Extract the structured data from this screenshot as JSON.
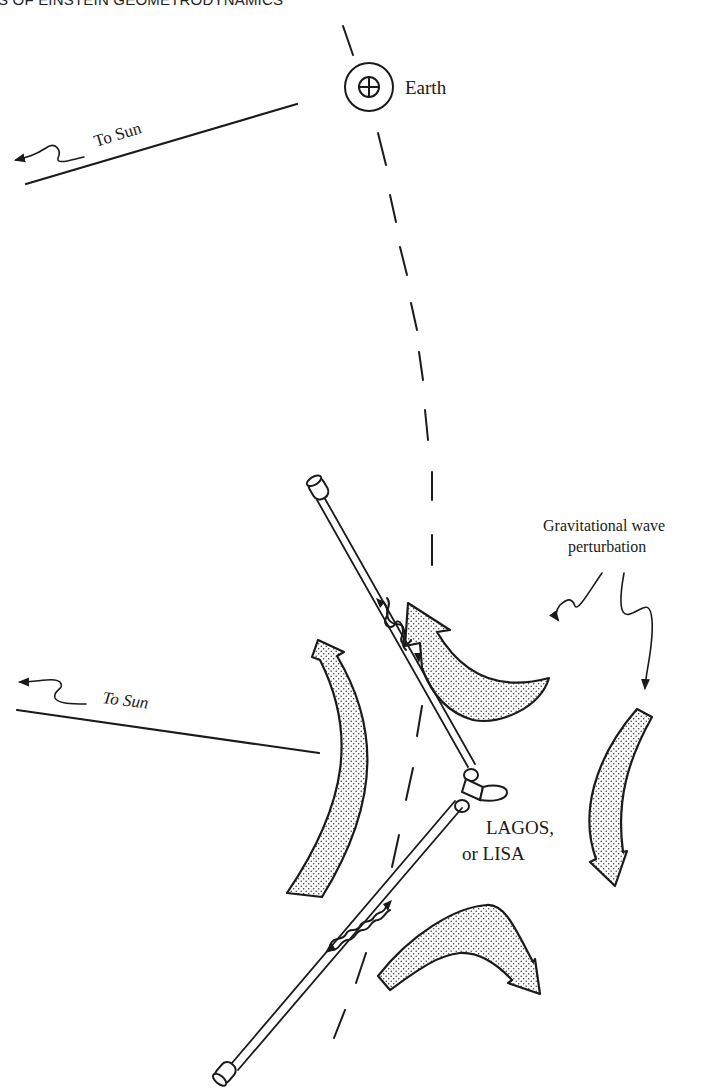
{
  "header": {
    "running_title": "S OF EINSTEIN GEOMETRODYNAMICS"
  },
  "figure": {
    "earth": {
      "label": "Earth",
      "symbol": "earth-symbol-circled-plus"
    },
    "sun_direction_upper": {
      "label": "To Sun"
    },
    "sun_direction_lower": {
      "label": "To Sun"
    },
    "wave_annotation": {
      "line1": "Gravitational wave",
      "line2": "perturbation"
    },
    "detector": {
      "line1": "LAGOS,",
      "line2": "or LISA"
    },
    "colors": {
      "ink": "#1a1a1a",
      "background": "#ffffff",
      "stipple": "#333333"
    }
  }
}
